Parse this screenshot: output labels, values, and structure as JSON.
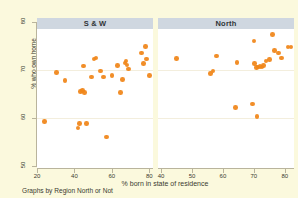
{
  "chart_data": {
    "type": "scatter",
    "title": "",
    "xlabel": "% born in state of residence",
    "ylabel": "% who own home",
    "caption": "Graphs by Region North or Not",
    "grid": true,
    "legend": "none",
    "marker_color": "#f08519",
    "panel_header_color": "#cfd7e0",
    "background_color": "#fbf9dd",
    "plot_background_color": "#ffffff",
    "ylim": [
      50,
      80
    ],
    "yticks": [
      50,
      60,
      70,
      80
    ],
    "panels": [
      {
        "label": "S & W",
        "xlim": [
          20,
          82
        ],
        "xticks": [
          20,
          40,
          60,
          80
        ],
        "points": [
          [
            24.0,
            59.3
          ],
          [
            30.5,
            69.5
          ],
          [
            35.0,
            67.8
          ],
          [
            42.0,
            57.9
          ],
          [
            42.6,
            58.8
          ],
          [
            43.2,
            65.5
          ],
          [
            44.3,
            65.7
          ],
          [
            45.4,
            65.3
          ],
          [
            45.0,
            70.8
          ],
          [
            46.6,
            58.9
          ],
          [
            49.0,
            68.5
          ],
          [
            50.4,
            72.3
          ],
          [
            51.6,
            72.5
          ],
          [
            54.0,
            69.8
          ],
          [
            55.6,
            68.5
          ],
          [
            57.0,
            56.0
          ],
          [
            60.0,
            68.8
          ],
          [
            63.0,
            70.9
          ],
          [
            64.6,
            65.3
          ],
          [
            65.6,
            68.0
          ],
          [
            67.0,
            71.5
          ],
          [
            67.6,
            71.9
          ],
          [
            68.2,
            71.0
          ],
          [
            69.0,
            70.2
          ],
          [
            76.0,
            73.5
          ],
          [
            77.0,
            71.3
          ],
          [
            78.0,
            74.9
          ],
          [
            78.4,
            72.3
          ],
          [
            80.0,
            68.8
          ]
        ]
      },
      {
        "label": "North",
        "xlim": [
          39,
          83
        ],
        "xticks": [
          40,
          50,
          60,
          70,
          80
        ],
        "points": [
          [
            45.0,
            72.4
          ],
          [
            56.0,
            69.3
          ],
          [
            56.8,
            69.8
          ],
          [
            58.0,
            72.9
          ],
          [
            64.0,
            62.2
          ],
          [
            64.6,
            71.6
          ],
          [
            69.5,
            62.9
          ],
          [
            70.0,
            76.0
          ],
          [
            70.2,
            71.4
          ],
          [
            70.8,
            70.5
          ],
          [
            71.0,
            60.3
          ],
          [
            71.4,
            70.6
          ],
          [
            72.0,
            70.7
          ],
          [
            72.6,
            70.6
          ],
          [
            73.2,
            70.9
          ],
          [
            74.0,
            71.9
          ],
          [
            75.0,
            72.2
          ],
          [
            76.0,
            77.4
          ],
          [
            76.6,
            74.1
          ],
          [
            78.0,
            73.5
          ],
          [
            79.0,
            72.5
          ],
          [
            81.0,
            74.8
          ],
          [
            82.0,
            74.8
          ]
        ]
      }
    ]
  }
}
